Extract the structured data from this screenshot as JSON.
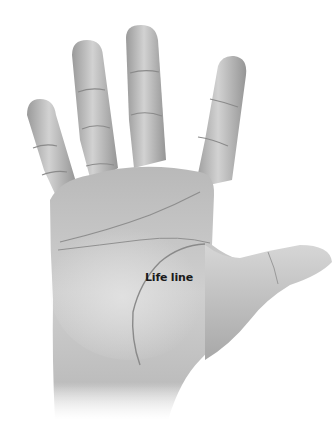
{
  "figure": {
    "annotation": {
      "label": "Life line",
      "line_color": "#8a8a8a"
    },
    "colors": {
      "background": "#ffffff",
      "skin_light": "#dcdcdc",
      "skin_mid": "#b5b5b5",
      "skin_dark": "#8c8c8c",
      "label_text": "#1a1a1a"
    }
  }
}
